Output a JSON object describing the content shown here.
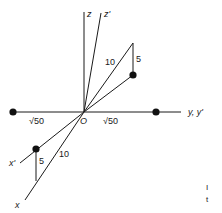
{
  "figure": {
    "axes": {
      "z": "z",
      "z_prime": "z'",
      "y": "y, y'",
      "x": "x",
      "x_prime": "x'",
      "origin": "O"
    },
    "lengths": {
      "upper_hyp": "10",
      "upper_leg": "5",
      "lower_hyp": "10",
      "lower_leg": "5",
      "left_y": "√50",
      "right_y": "√50"
    },
    "colors": {
      "line": "#1a1a1a",
      "point": "#111111",
      "background": "#ffffff"
    },
    "margin_marks": [
      "I",
      "t"
    ]
  }
}
